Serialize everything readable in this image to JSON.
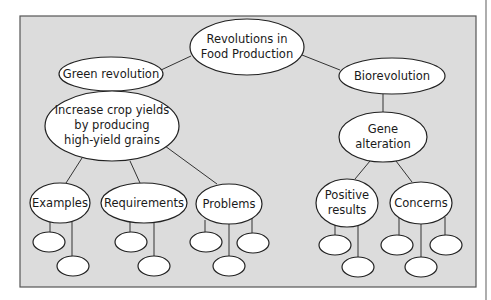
{
  "diagram": {
    "type": "concept-map",
    "colors": {
      "background": "#dcdcdc",
      "node_fill": "#ffffff",
      "stroke": "#222222",
      "frame": "#555555"
    },
    "root": {
      "lines": [
        "Revolutions in",
        "Food Production"
      ]
    },
    "branches": [
      {
        "label": "Green revolution"
      },
      {
        "label": "Biorevolution"
      }
    ],
    "green": {
      "goal": {
        "lines": [
          "Increase crop yields",
          "by producing",
          "high-yield grains"
        ]
      },
      "children": [
        {
          "label": "Examples"
        },
        {
          "label": "Requirements"
        },
        {
          "label": "Problems"
        }
      ]
    },
    "bio": {
      "goal": {
        "lines": [
          "Gene",
          "alteration"
        ]
      },
      "children": [
        {
          "lines": [
            "Positive",
            "results"
          ]
        },
        {
          "label": "Concerns"
        }
      ]
    },
    "empty_leaf_count": 11
  }
}
